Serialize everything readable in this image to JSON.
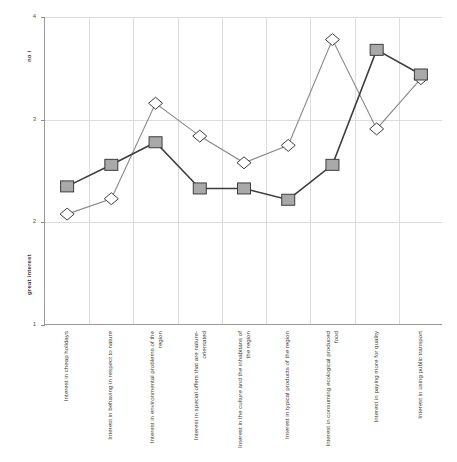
{
  "chart_data": {
    "type": "line",
    "title": "",
    "xlabel": "",
    "ylabel": "",
    "ylim": [
      1,
      4
    ],
    "yticks": [
      1,
      2,
      3,
      4
    ],
    "ytick_labels": [
      "1",
      "2",
      "3",
      "4"
    ],
    "grid": true,
    "legend": "none",
    "y_axis_top_label": "no i",
    "y_axis_bottom_label": "great interest",
    "categories": [
      "Interest in cheap holidays",
      "Interest in behaving in respect to nature",
      "Interest in environmental problems of the region",
      "Interest in special offers that are nature-orientated",
      "Interest in the culture and the inhabitans of the region",
      "Interest in typical products of the region",
      "Interest in consuming ecological produced food",
      "Interest in paying more for quality",
      "Interest in using public transport"
    ],
    "series": [
      {
        "name": "square-series",
        "marker": "square",
        "color": "#a9a9a9",
        "line_color": "#3d3d3d",
        "values": [
          2.35,
          2.56,
          2.78,
          2.33,
          2.33,
          2.22,
          2.56,
          3.68,
          3.44
        ]
      },
      {
        "name": "diamond-series",
        "marker": "diamond",
        "color": "#ffffff",
        "line_color": "#8a8a8a",
        "values": [
          2.08,
          2.23,
          3.16,
          2.84,
          2.58,
          2.75,
          3.78,
          2.91,
          3.4
        ]
      }
    ]
  }
}
